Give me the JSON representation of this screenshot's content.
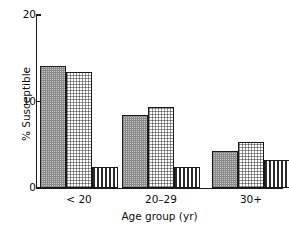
{
  "chart_data": {
    "type": "bar",
    "title": "",
    "subtitle": "",
    "xlabel": "Age group (yr)",
    "ylabel": "% Susceptible",
    "categories": [
      "< 20",
      "20–29",
      "30+"
    ],
    "ylim": [
      0,
      20
    ],
    "yticks": [
      0,
      10,
      20
    ],
    "ytick_labels": [
      "0",
      "10",
      "20"
    ],
    "grid": false,
    "legend": "none",
    "series": [
      {
        "name": "series-1",
        "pattern": "dark-dotted",
        "values": [
          14.1,
          8.4,
          4.3
        ]
      },
      {
        "name": "series-2",
        "pattern": "light-dotted",
        "values": [
          13.4,
          9.4,
          5.3
        ]
      },
      {
        "name": "series-3",
        "pattern": "vertical-stripe",
        "values": [
          2.4,
          2.4,
          3.2
        ]
      }
    ]
  },
  "axes": {
    "y_title": "% Susceptible",
    "x_title": "Age group (yr)",
    "y_ticks": [
      {
        "value": 20,
        "label": "20"
      },
      {
        "value": 10,
        "label": "10"
      },
      {
        "value": 0,
        "label": "0"
      }
    ],
    "x_ticks": [
      {
        "label": "< 20"
      },
      {
        "label": "20–29"
      },
      {
        "label": "30+"
      }
    ]
  },
  "colors": {
    "axis": "#1a1a1a",
    "bar_outline": "#1a1a1a",
    "fill_dark": "#c9c9c9",
    "fill_light": "#f0f0f0",
    "fill_stripe": "#2b2b2b",
    "background": "#ffffff",
    "text": "#0d0d0d"
  }
}
